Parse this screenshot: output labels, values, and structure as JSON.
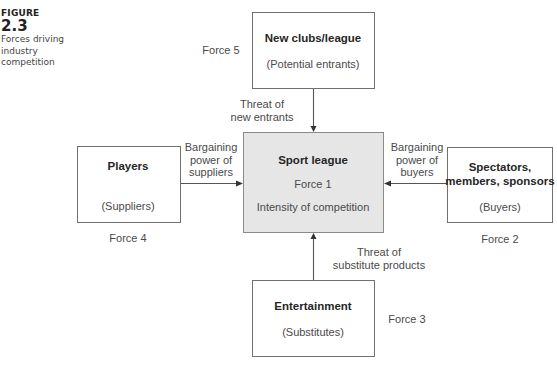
{
  "figure": {
    "label": "FIGURE",
    "number": "2.3",
    "caption_lines": [
      "Forces driving",
      "industry",
      "competition"
    ]
  },
  "diagram": {
    "center": {
      "title": "Sport league",
      "force": "Force 1",
      "subtitle": "Intensity of competition"
    },
    "top": {
      "title": "New clubs/league",
      "subtitle": "(Potential entrants)",
      "force": "Force 5",
      "arrow_label": [
        "Threat of",
        "new entrants"
      ]
    },
    "left": {
      "title": "Players",
      "subtitle": "(Suppliers)",
      "force": "Force 4",
      "arrow_label": [
        "Bargaining",
        "power of",
        "suppliers"
      ]
    },
    "right": {
      "title_lines": [
        "Spectators,",
        "members, sponsors"
      ],
      "subtitle": "(Buyers)",
      "force": "Force 2",
      "arrow_label": [
        "Bargaining",
        "power of",
        "buyers"
      ]
    },
    "bottom": {
      "title": "Entertainment",
      "subtitle": "(Substitutes)",
      "force": "Force 3",
      "arrow_label": [
        "Threat of",
        "substitute products"
      ]
    }
  },
  "colors": {
    "center_fill": "#e6e6e6",
    "box_border": "#707070",
    "line": "#555555"
  }
}
